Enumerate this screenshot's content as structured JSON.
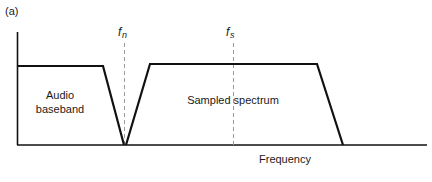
{
  "figure": {
    "panel_label": "(a)",
    "x_axis_title": "Frequency",
    "markers": [
      {
        "name": "nyquist",
        "symbol": "f",
        "subscript": "n"
      },
      {
        "name": "sampling",
        "symbol": "f",
        "subscript": "s"
      }
    ],
    "regions": [
      {
        "name": "audio-baseband",
        "lines": [
          "Audio",
          "baseband"
        ]
      },
      {
        "name": "sampled-spectrum",
        "lines": [
          "Sampled spectrum"
        ]
      }
    ],
    "colors": {
      "line": "#111111",
      "dashed": "#9a9a9a",
      "text": "#1a1a1a",
      "background": "#ffffff"
    }
  }
}
